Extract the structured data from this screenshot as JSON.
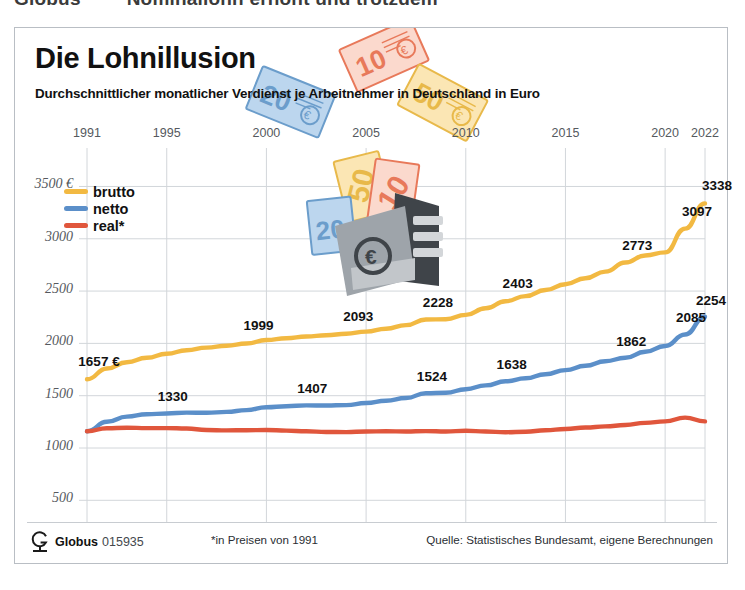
{
  "page_header": {
    "left_fragment": "Globus",
    "right_fragment": "Nominallohn erhöht und trotzdem"
  },
  "card": {
    "title": "Die Lohnillusion",
    "subtitle": "Durchschnittlicher monatlicher Verdienst je Arbeitnehmer in Deutschland in Euro"
  },
  "legend": {
    "items": [
      {
        "label": "brutto",
        "color": "#F2B942"
      },
      {
        "label": "netto",
        "color": "#5B8FC9"
      },
      {
        "label": "real*",
        "color": "#E0563C"
      }
    ]
  },
  "footer": {
    "brand": "Globus",
    "number": "015935",
    "note": "*in Preisen von 1991",
    "source": "Quelle: Statistisches Bundesamt, eigene Berechnungen"
  },
  "illustration": {
    "notes": [
      "20",
      "10",
      "50"
    ],
    "wallet_symbol": "€"
  },
  "chart_data": {
    "type": "line",
    "title": "Die Lohnillusion",
    "subtitle": "Durchschnittlicher monatlicher Verdienst je Arbeitnehmer in Deutschland in Euro",
    "xlabel": "",
    "ylabel": "Euro",
    "xlim": [
      1991,
      2022
    ],
    "ylim": [
      350,
      3600
    ],
    "grid": true,
    "legend_position": "top-left",
    "x_ticks": [
      1991,
      1995,
      2000,
      2005,
      2010,
      2015,
      2020,
      2022
    ],
    "x_tick_labels": [
      "1991",
      "1995",
      "2000",
      "2005",
      "2010",
      "2015",
      "2020",
      "2022"
    ],
    "y_ticks": [
      500,
      1000,
      1500,
      2000,
      2500,
      3000,
      3500
    ],
    "y_tick_labels": [
      "500",
      "1000",
      "1500",
      "2000",
      "2500",
      "3000",
      "3500 €"
    ],
    "x": [
      1991,
      1992,
      1993,
      1994,
      1995,
      1996,
      1997,
      1998,
      1999,
      2000,
      2001,
      2002,
      2003,
      2004,
      2005,
      2006,
      2007,
      2008,
      2009,
      2010,
      2011,
      2012,
      2013,
      2014,
      2015,
      2016,
      2017,
      2018,
      2019,
      2020,
      2021,
      2022
    ],
    "series": [
      {
        "name": "brutto",
        "color": "#F2B942",
        "values": [
          1657,
          1760,
          1820,
          1862,
          1900,
          1935,
          1960,
          1978,
          1999,
          2032,
          2050,
          2066,
          2078,
          2093,
          2113,
          2140,
          2175,
          2228,
          2230,
          2272,
          2335,
          2403,
          2452,
          2510,
          2566,
          2623,
          2686,
          2773,
          2840,
          2870,
          3097,
          3338
        ]
      },
      {
        "name": "netto",
        "color": "#5B8FC9",
        "values": [
          1161,
          1250,
          1300,
          1322,
          1330,
          1338,
          1336,
          1345,
          1362,
          1390,
          1400,
          1407,
          1406,
          1410,
          1430,
          1452,
          1478,
          1524,
          1528,
          1562,
          1598,
          1638,
          1666,
          1705,
          1745,
          1786,
          1830,
          1862,
          1920,
          1975,
          2085,
          2254
        ]
      },
      {
        "name": "real*",
        "color": "#E0563C",
        "values": [
          1161,
          1188,
          1194,
          1190,
          1190,
          1186,
          1172,
          1168,
          1170,
          1172,
          1166,
          1160,
          1153,
          1152,
          1158,
          1160,
          1158,
          1162,
          1158,
          1165,
          1158,
          1151,
          1155,
          1170,
          1182,
          1196,
          1206,
          1220,
          1240,
          1254,
          1291,
          1254
        ]
      }
    ],
    "point_labels": {
      "brutto": [
        {
          "year": 1991,
          "text": "1657 €"
        },
        {
          "year": 1999,
          "text": "1999"
        },
        {
          "year": 2004,
          "text": "2093"
        },
        {
          "year": 2008,
          "text": "2228"
        },
        {
          "year": 2012,
          "text": "2403"
        },
        {
          "year": 2018,
          "text": "2773"
        },
        {
          "year": 2021,
          "text": "3097"
        },
        {
          "year": 2022,
          "text": "3338"
        }
      ],
      "netto": [
        {
          "year": 1995,
          "text": "1330"
        },
        {
          "year": 2002,
          "text": "1407"
        },
        {
          "year": 2008,
          "text": "1524"
        },
        {
          "year": 2012,
          "text": "1638"
        },
        {
          "year": 2018,
          "text": "1862"
        },
        {
          "year": 2021,
          "text": "2085"
        },
        {
          "year": 2022,
          "text": "2254"
        }
      ],
      "real": [
        {
          "year": 1991,
          "text": "1161"
        },
        {
          "year": 1996,
          "text": "1160"
        },
        {
          "year": 2002,
          "text": "1153"
        },
        {
          "year": 2007,
          "text": "1158"
        },
        {
          "year": 2012,
          "text": "1151"
        },
        {
          "year": 2017,
          "text": "1220"
        },
        {
          "year": 2021,
          "text": "1291"
        },
        {
          "year": 2022,
          "text": "1254"
        }
      ]
    }
  }
}
